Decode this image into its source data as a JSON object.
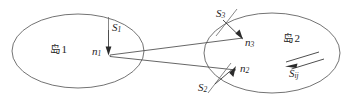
{
  "figure": {
    "type": "geometry-diagram",
    "background_color": "#ffffff",
    "line_color": "#5a5a5a",
    "text_color": "#1e1e1e"
  },
  "regions": [
    {
      "id": "island-1",
      "label_text": "岛",
      "label_number": "1",
      "center_x": 78,
      "center_y": 51,
      "radius_x": 66,
      "radius_y": 37
    },
    {
      "id": "island-2",
      "label_text": "岛",
      "label_number": "2",
      "center_x": 272,
      "center_y": 53,
      "radius_x": 68,
      "radius_y": 40
    }
  ],
  "normals": [
    {
      "id": "n1",
      "symbol": "n",
      "subscript": "1",
      "surface_symbol": "S",
      "surface_subscript": "1"
    },
    {
      "id": "n2",
      "symbol": "n",
      "subscript": "2",
      "surface_symbol": "S",
      "surface_subscript": "2"
    },
    {
      "id": "n3",
      "symbol": "n",
      "subscript": "3",
      "surface_symbol": "S",
      "surface_subscript": "3"
    }
  ],
  "vector": {
    "id": "Sij",
    "symbol": "S",
    "subscript": "ij"
  },
  "labels": {
    "island1": "岛",
    "island1_num": "1",
    "island2": "岛",
    "island2_num": "2",
    "n1": "n",
    "n1_sub": "1",
    "n2": "n",
    "n2_sub": "2",
    "n3": "n",
    "n3_sub": "3",
    "S1": "S",
    "S1_sub": "1",
    "S2": "S",
    "S2_sub": "2",
    "S3": "S",
    "S3_sub": "3",
    "Sij": "S",
    "Sij_sub": "ij"
  }
}
